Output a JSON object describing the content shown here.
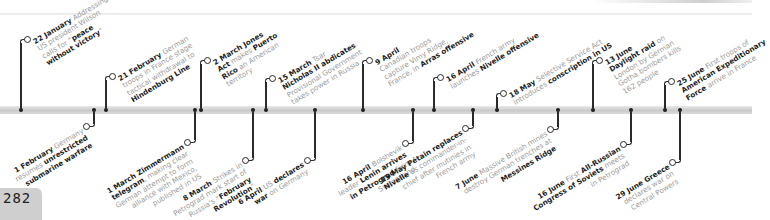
{
  "page": {
    "number": "282"
  },
  "timeline": {
    "year": "1917",
    "bar_color": "#cccccc",
    "ink_color": "#1f1f1f",
    "muted_text_color": "#9a9a9a"
  },
  "events_above": [
    {
      "date": "22 January",
      "parts": [
        [
          "Addressing Senate, US president Wilson calls for “",
          false
        ],
        [
          "peace without victory",
          true
        ],
        [
          "”",
          false
        ]
      ],
      "lines": [
        "Addressing Senate,",
        "US president Wilson",
        "calls for “|peace|",
        "|without victory|”"
      ]
    },
    {
      "date": "21 February",
      "lines": [
        "German",
        "troops in France stage",
        "tactical withdrawal to",
        "|Hindenburg Line|"
      ]
    },
    {
      "date": "2 March",
      "lines": [
        "|Jones|",
        "|Act| makes |Puerto|",
        "|Rico| an American",
        "territory"
      ]
    },
    {
      "date": "15 March",
      "lines": [
        "Tsar",
        "|Nicholas II abdicates|.",
        "Provisional Government",
        "takes power in Russia"
      ]
    },
    {
      "date": "9 April",
      "lines": [
        "",
        "Canadian troops",
        "capture Vimy Ridge,",
        "France, in |Arras offensive|"
      ]
    },
    {
      "date": "16 April",
      "lines": [
        "French army",
        "launches |Nivelle offensive|"
      ]
    },
    {
      "date": "18 May",
      "lines": [
        "Selective Service Act",
        "introduces |conscription in US|"
      ]
    },
    {
      "date": "13 June",
      "lines": [
        "",
        "|Daylight raid| on",
        "London by German",
        "Gotha bombers kills",
        "162 people"
      ]
    },
    {
      "date": "25 June",
      "lines": [
        "First troops of",
        "|American Expeditionary|",
        "|Force| arrive in France"
      ]
    }
  ],
  "events_below": [
    {
      "date": "1 February",
      "lines": [
        "Germany",
        "resumes |unrestricted|",
        "|submarine warfare|"
      ]
    },
    {
      "date": "1 March",
      "lines": [
        "|Zimmermann|",
        "|telegram|, making clear",
        "German attempt to form",
        "alliance with Mexico,",
        "published in US"
      ]
    },
    {
      "date": "8 March",
      "lines": [
        "Strikes in",
        "Petrograd mark start of",
        "Russia's “|February|",
        "|Revolution|”"
      ]
    },
    {
      "date": "6 April",
      "lines": [
        "US |declares|",
        "|war| on Germany"
      ]
    },
    {
      "date": "16 April",
      "lines": [
        "Bolshevik",
        "leader |Lenin arrives|",
        "|in Petrograd| from",
        "Switzerland"
      ]
    },
    {
      "date": "15 May",
      "lines": [
        "|Pétain replaces|",
        "|Nivelle| as commander-in-",
        "chief after mutinies in",
        "French army"
      ]
    },
    {
      "date": "7 June",
      "lines": [
        "Massive British mines",
        "destroy German trenches at",
        "|Messines Ridge|"
      ]
    },
    {
      "date": "16 June",
      "lines": [
        "First |All-Russian|",
        "|Congress of Soviets| meets",
        "in Petrograd"
      ]
    },
    {
      "date": "29 June",
      "lines": [
        "|Greece|",
        "declares war on",
        "Central Powers"
      ]
    }
  ]
}
